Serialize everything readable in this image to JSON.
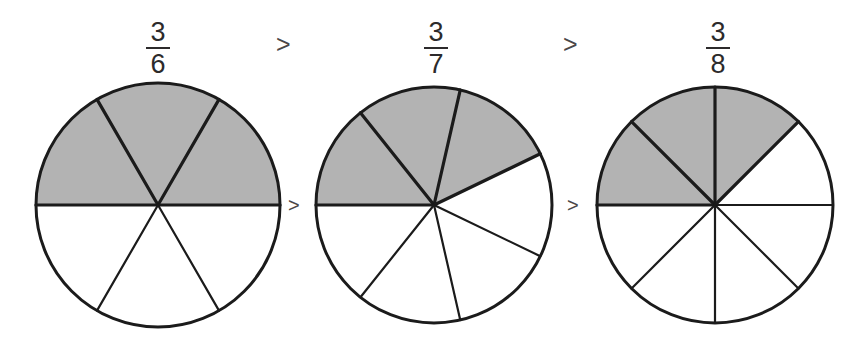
{
  "page": {
    "background_color": "#ffffff",
    "width": 864,
    "height": 345
  },
  "style": {
    "shaded_color": "#b3b3b3",
    "unshaded_color": "#ffffff",
    "line_color": "#1b1b1b",
    "text_color": "#2c2a2b"
  },
  "comparison": {
    "operators": [
      {
        "symbol": ">",
        "name": "greater-than-1"
      },
      {
        "symbol": ">",
        "name": "greater-than-2"
      }
    ],
    "statement": "3/6 > 3/7 > 3/8"
  },
  "items": [
    {
      "id": "fraction-three-sixths",
      "numerator": "3",
      "denominator": "6",
      "total_parts": 6,
      "shaded_parts": 3,
      "value": 0.5,
      "circle": {
        "cx": 158,
        "cy": 205,
        "r": 122,
        "start_angle_deg": 180,
        "sweep_dir": "clockwise"
      }
    },
    {
      "id": "fraction-three-sevenths",
      "numerator": "3",
      "denominator": "7",
      "total_parts": 7,
      "shaded_parts": 3,
      "value": 0.4286,
      "circle": {
        "cx": 434,
        "cy": 205,
        "r": 118,
        "start_angle_deg": 180,
        "sweep_dir": "clockwise"
      }
    },
    {
      "id": "fraction-three-eighths",
      "numerator": "3",
      "denominator": "8",
      "total_parts": 8,
      "shaded_parts": 3,
      "value": 0.375,
      "circle": {
        "cx": 715,
        "cy": 205,
        "r": 118,
        "start_angle_deg": 180,
        "sweep_dir": "clockwise"
      }
    }
  ],
  "chart_data": {
    "type": "pie",
    "title": "",
    "xlabel": "",
    "ylabel": "",
    "legend": [],
    "charts": [
      {
        "label": "3/6",
        "slices": 6,
        "shaded": 3,
        "slice_angle_deg": 60,
        "shaded_fraction": 0.5,
        "values": [
          1,
          1,
          1,
          1,
          1,
          1
        ],
        "shaded_flags": [
          true,
          true,
          true,
          false,
          false,
          false
        ]
      },
      {
        "label": "3/7",
        "slices": 7,
        "shaded": 3,
        "slice_angle_deg": 51.4286,
        "shaded_fraction": 0.4286,
        "values": [
          1,
          1,
          1,
          1,
          1,
          1,
          1
        ],
        "shaded_flags": [
          true,
          true,
          true,
          false,
          false,
          false,
          false
        ]
      },
      {
        "label": "3/8",
        "slices": 8,
        "shaded": 3,
        "slice_angle_deg": 45,
        "shaded_fraction": 0.375,
        "values": [
          1,
          1,
          1,
          1,
          1,
          1,
          1,
          1
        ],
        "shaded_flags": [
          true,
          true,
          true,
          false,
          false,
          false,
          false,
          false
        ]
      }
    ],
    "relation": "3/6 > 3/7 > 3/8"
  },
  "labels": {
    "fraction_1": {
      "numerator": "3",
      "denominator": "6"
    },
    "fraction_2": {
      "numerator": "3",
      "denominator": "7"
    },
    "fraction_3": {
      "numerator": "3",
      "denominator": "8"
    },
    "operator_top_1": ">",
    "operator_top_2": ">",
    "operator_mid_1": ">",
    "operator_mid_2": ">"
  }
}
